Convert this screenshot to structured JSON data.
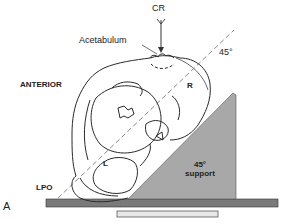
{
  "labels": {
    "cr": "CR",
    "acetabulum": "Acetabulum",
    "angle": "45°",
    "anterior": "ANTERIOR",
    "right": "R",
    "left": "L",
    "lpo": "LPO",
    "support_angle": "45°",
    "support_text": "support",
    "panel": "A"
  },
  "colors": {
    "outline": "#2a2a2a",
    "support_fill": "#a8a8a8",
    "table_fill": "#7a7a7a",
    "detector_fill": "#e8e8e8",
    "dashed_line": "#888888"
  }
}
